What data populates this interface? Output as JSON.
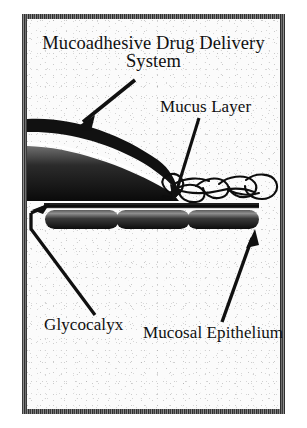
{
  "figure": {
    "kind": "scientific-schematic",
    "background_color": "#fbfbfb",
    "ink_color": "#101010",
    "frame_color": "#4a4a4a"
  },
  "labels": {
    "title_line1": "Mucoadhesive Drug Delivery",
    "title_line2": "System",
    "mucus_layer": "Mucus Layer",
    "glycocalyx": "Glycocalyx",
    "mucosal_epithelium": "Mucosal Epithelium"
  },
  "structures": [
    {
      "id": "dds",
      "name": "Mucoadhesive Drug Delivery System",
      "shape": "tapered lens / wedge, two dark bands",
      "fill": "#111111"
    },
    {
      "id": "mucus",
      "name": "Mucus Layer",
      "shape": "tangled looping strands",
      "fill": "none",
      "stroke": "#0d0d0d"
    },
    {
      "id": "glycocalyx",
      "name": "Glycocalyx",
      "shape": "thin horizontal line above cells",
      "fill": "#1a1a1a"
    },
    {
      "id": "epithelium",
      "name": "Mucosal Epithelium",
      "shape": "three rounded capsule cells",
      "cell_count": 3,
      "fill": "#2a2a2a"
    }
  ],
  "annotations": [
    {
      "id": "arrow-dds",
      "label_ref": "title_line2",
      "points_to": "dds",
      "direction": "down-left"
    },
    {
      "id": "arrow-mucus",
      "label_ref": "mucus_layer",
      "points_to": "mucus",
      "direction": "down-left"
    },
    {
      "id": "arrow-glyco",
      "label_ref": "glycocalyx",
      "points_to": "glycocalyx",
      "direction": "up-then-left, head up-right",
      "bent": true
    },
    {
      "id": "arrow-epi",
      "label_ref": "mucosal_epithelium",
      "points_to": "epithelium",
      "direction": "up-right"
    }
  ]
}
